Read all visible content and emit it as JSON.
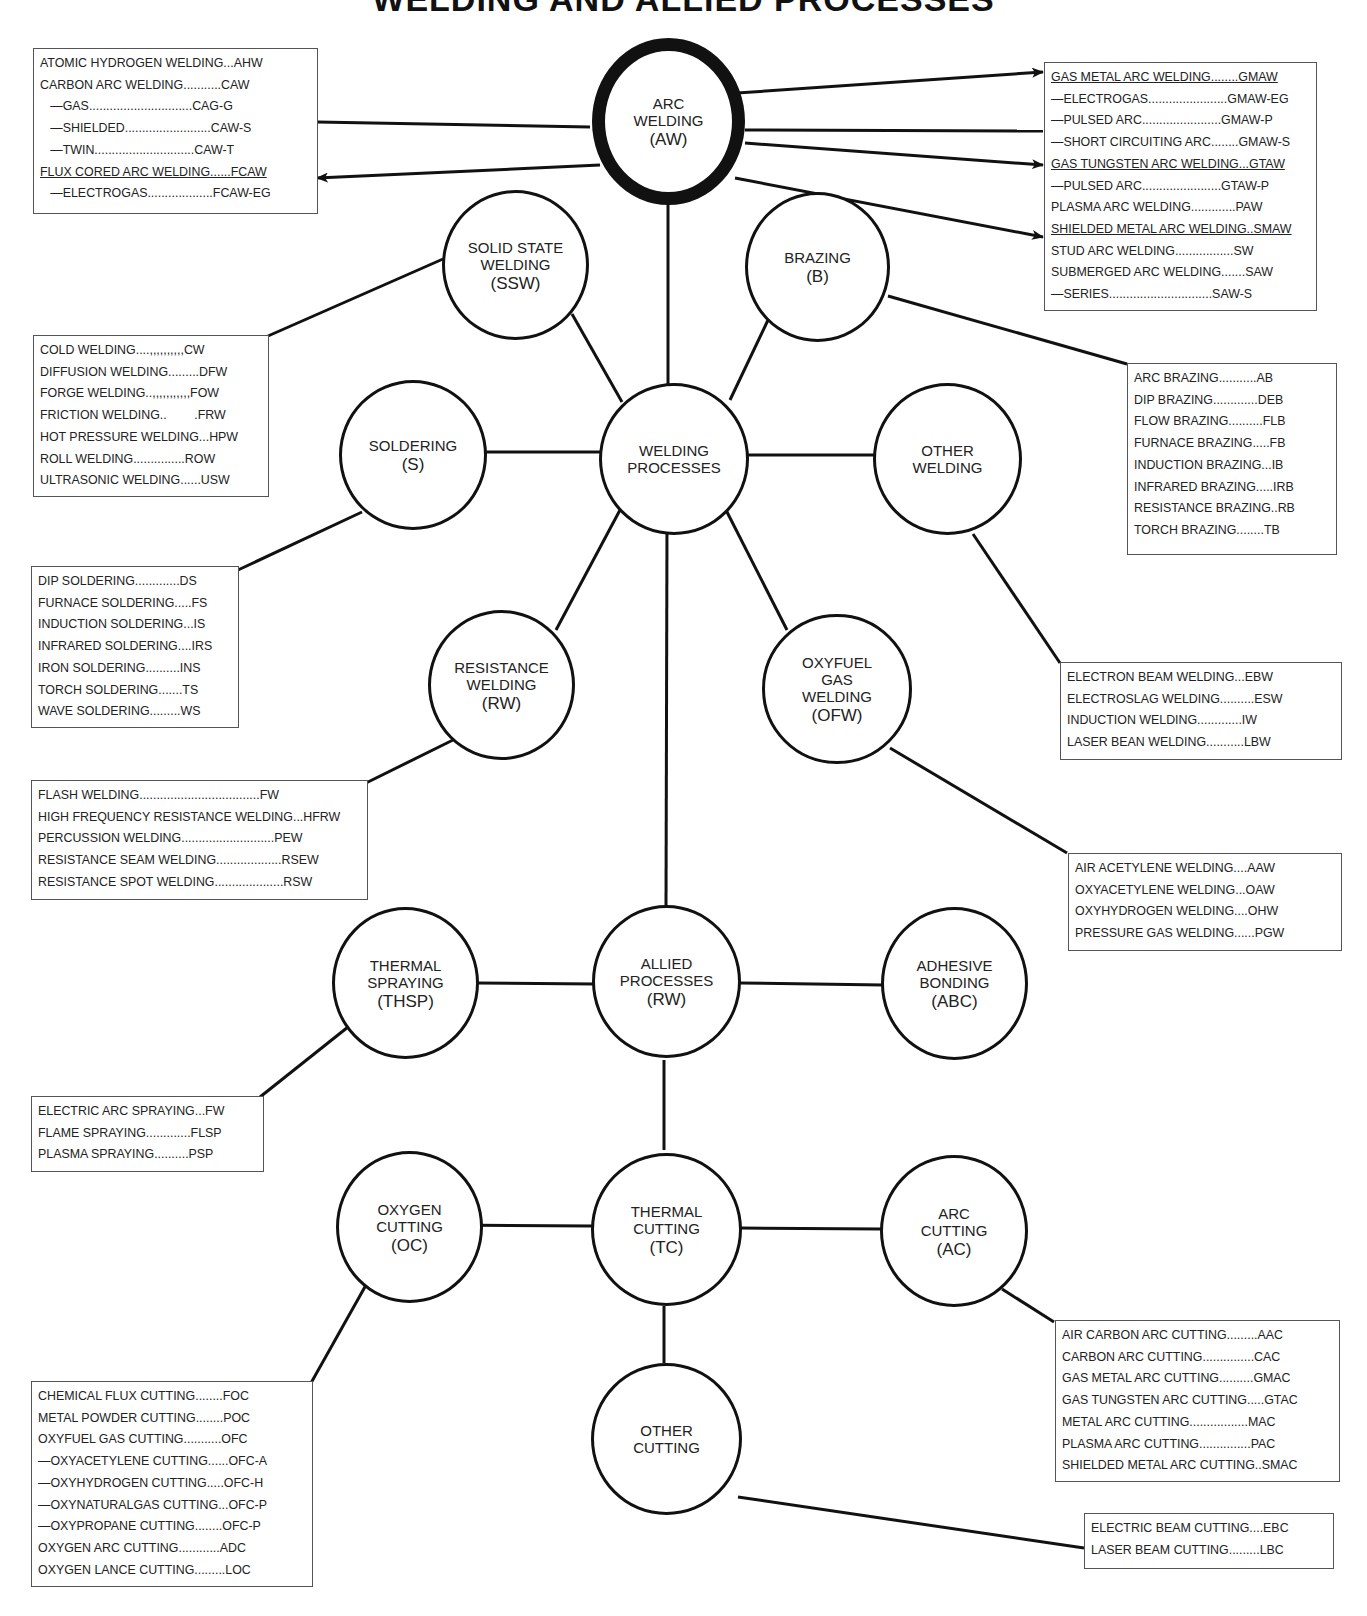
{
  "title": "WELDING AND ALLIED PROCESSES",
  "nodes": {
    "arc_welding": {
      "lines": [
        "ARC",
        "WELDING"
      ],
      "abbr": "(AW)"
    },
    "solid_state": {
      "lines": [
        "SOLID STATE",
        "WELDING"
      ],
      "abbr": "(SSW)"
    },
    "brazing": {
      "lines": [
        "BRAZING"
      ],
      "abbr": "(B)"
    },
    "soldering": {
      "lines": [
        "SOLDERING"
      ],
      "abbr": "(S)"
    },
    "welding_processes": {
      "lines": [
        "WELDING",
        "PROCESSES"
      ],
      "abbr": ""
    },
    "other_welding": {
      "lines": [
        "OTHER",
        "WELDING"
      ],
      "abbr": ""
    },
    "resistance": {
      "lines": [
        "RESISTANCE",
        "WELDING"
      ],
      "abbr": "(RW)"
    },
    "oxyfuel": {
      "lines": [
        "OXYFUEL",
        "GAS",
        "WELDING"
      ],
      "abbr": "(OFW)"
    },
    "thermal_spraying": {
      "lines": [
        "THERMAL",
        "SPRAYING"
      ],
      "abbr": "(THSP)"
    },
    "allied": {
      "lines": [
        "ALLIED",
        "PROCESSES"
      ],
      "abbr": "(RW)"
    },
    "adhesive": {
      "lines": [
        "ADHESIVE",
        "BONDING"
      ],
      "abbr": "(ABC)"
    },
    "oxygen_cutting": {
      "lines": [
        "OXYGEN",
        "CUTTING"
      ],
      "abbr": "(OC)"
    },
    "thermal_cutting": {
      "lines": [
        "THERMAL",
        "CUTTING"
      ],
      "abbr": "(TC)"
    },
    "arc_cutting": {
      "lines": [
        "ARC",
        "CUTTING"
      ],
      "abbr": "(AC)"
    },
    "other_cutting": {
      "lines": [
        "OTHER",
        "CUTTING"
      ],
      "abbr": ""
    }
  },
  "boxes": {
    "arc_left": [
      {
        "text": "ATOMIC HYDROGEN WELDING...AHW"
      },
      {
        "text": "CARBON ARC WELDING...........CAW"
      },
      {
        "text": "   —GAS..............................CAG-G"
      },
      {
        "text": "   —SHIELDED.........................CAW-S"
      },
      {
        "text": "   —TWIN.............................CAW-T"
      },
      {
        "text": "FLUX CORED ARC WELDING......FCAW",
        "underline": true
      },
      {
        "text": "   —ELECTROGAS...................FCAW-EG"
      }
    ],
    "arc_right": [
      {
        "text": "GAS METAL ARC WELDING........GMAW",
        "underline": true
      },
      {
        "text": "—ELECTROGAS.......................GMAW-EG"
      },
      {
        "text": "—PULSED ARC.......................GMAW-P"
      },
      {
        "text": "—SHORT CIRCUITING ARC........GMAW-S"
      },
      {
        "text": "GAS TUNGSTEN ARC WELDING...GTAW",
        "underline": true
      },
      {
        "text": "—PULSED ARC.......................GTAW-P"
      },
      {
        "text": "PLASMA ARC WELDING.............PAW"
      },
      {
        "text": "SHIELDED METAL ARC WELDING..SMAW",
        "underline": true
      },
      {
        "text": "STUD ARC WELDING.................SW"
      },
      {
        "text": "SUBMERGED ARC WELDING.......SAW"
      },
      {
        "text": "—SERIES..............................SAW-S"
      }
    ],
    "solid_state": [
      {
        "text": "COLD WELDING....,,,,,,,,,,CW"
      },
      {
        "text": "DIFFUSION WELDING.........DFW"
      },
      {
        "text": "FORGE WELDING..,,,,,,,,,,,FOW"
      },
      {
        "text": "FRICTION WELDING..        .FRW"
      },
      {
        "text": "HOT PRESSURE WELDING...HPW"
      },
      {
        "text": "ROLL WELDING...............ROW"
      },
      {
        "text": "ULTRASONIC WELDING......USW"
      }
    ],
    "brazing": [
      {
        "text": "ARC BRAZING...........AB"
      },
      {
        "text": "DIP BRAZING.............DEB"
      },
      {
        "text": "FLOW BRAZING..........FLB"
      },
      {
        "text": "FURNACE BRAZING.....FB"
      },
      {
        "text": "INDUCTION BRAZING...IB"
      },
      {
        "text": "INFRARED BRAZING.....IRB"
      },
      {
        "text": "RESISTANCE BRAZING..RB"
      },
      {
        "text": "TORCH BRAZING........TB"
      }
    ],
    "soldering": [
      {
        "text": "DIP SOLDERING.............DS"
      },
      {
        "text": "FURNACE SOLDERING.....FS"
      },
      {
        "text": "INDUCTION SOLDERING...IS"
      },
      {
        "text": "INFRARED SOLDERING....IRS"
      },
      {
        "text": "IRON SOLDERING..........INS"
      },
      {
        "text": "TORCH SOLDERING.......TS"
      },
      {
        "text": "WAVE SOLDERING.........WS"
      }
    ],
    "other_welding": [
      {
        "text": "ELECTRON BEAM WELDING...EBW"
      },
      {
        "text": "ELECTROSLAG WELDING..........ESW"
      },
      {
        "text": "INDUCTION WELDING.............IW"
      },
      {
        "text": "LASER BEAN WELDING...........LBW"
      }
    ],
    "resistance": [
      {
        "text": "FLASH WELDING...................................FW"
      },
      {
        "text": "HIGH FREQUENCY RESISTANCE WELDING...HFRW"
      },
      {
        "text": "PERCUSSION WELDING...........................PEW"
      },
      {
        "text": "RESISTANCE SEAM WELDING...................RSEW"
      },
      {
        "text": "RESISTANCE SPOT WELDING....................RSW"
      }
    ],
    "oxyfuel": [
      {
        "text": "AIR ACETYLENE WELDING....AAW"
      },
      {
        "text": "OXYACETYLENE WELDING...OAW"
      },
      {
        "text": "OXYHYDROGEN WELDING....OHW"
      },
      {
        "text": "PRESSURE GAS WELDING......PGW"
      }
    ],
    "thermal_spraying": [
      {
        "text": "ELECTRIC ARC SPRAYING...FW"
      },
      {
        "text": "FLAME SPRAYING.............FLSP"
      },
      {
        "text": "PLASMA SPRAYING..........PSP"
      }
    ],
    "oxygen_cutting": [
      {
        "text": "CHEMICAL FLUX CUTTING........FOC"
      },
      {
        "text": "METAL POWDER CUTTING........POC"
      },
      {
        "text": "OXYFUEL GAS CUTTING...........OFC"
      },
      {
        "text": "—OXYACETYLENE CUTTING......OFC-A"
      },
      {
        "text": "—OXYHYDROGEN CUTTING.....OFC-H"
      },
      {
        "text": "—OXYNATURALGAS CUTTING...OFC-P"
      },
      {
        "text": "—OXYPROPANE CUTTING........OFC-P"
      },
      {
        "text": "OXYGEN ARC CUTTING............ADC"
      },
      {
        "text": "OXYGEN LANCE CUTTING.........LOC"
      }
    ],
    "arc_cutting": [
      {
        "text": "AIR CARBON ARC CUTTING.........AAC"
      },
      {
        "text": "CARBON ARC CUTTING...............CAC"
      },
      {
        "text": "GAS METAL ARC CUTTING..........GMAC"
      },
      {
        "text": "GAS TUNGSTEN ARC CUTTING.....GTAC"
      },
      {
        "text": "METAL ARC CUTTING.................MAC"
      },
      {
        "text": "PLASMA ARC CUTTING...............PAC"
      },
      {
        "text": "SHIELDED METAL ARC CUTTING..SMAC"
      }
    ],
    "other_cutting": [
      {
        "text": "ELECTRIC BEAM CUTTING....EBC"
      },
      {
        "text": "LASER BEAM CUTTING.........LBC"
      }
    ]
  }
}
